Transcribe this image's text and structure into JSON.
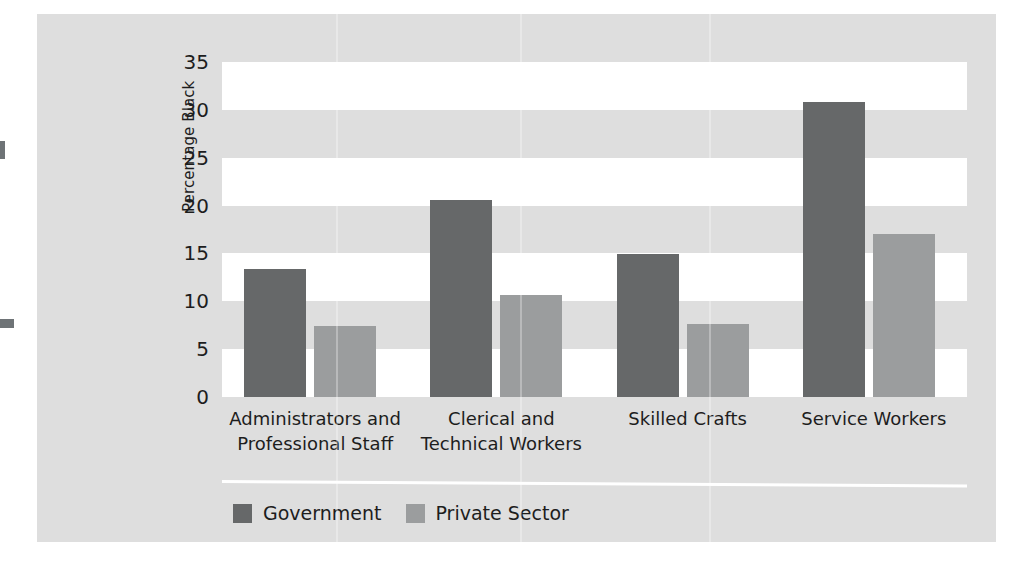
{
  "figure": {
    "panel_color": "#dedede",
    "plot_background": "#ffffff"
  },
  "chart_data": {
    "type": "bar",
    "title": "",
    "xlabel": "",
    "ylabel": "Percentage Black",
    "ylim": [
      0,
      35
    ],
    "yticks": [
      0,
      5,
      10,
      15,
      20,
      25,
      30,
      35
    ],
    "ytick_labels": [
      "0",
      "5",
      "10",
      "15",
      "20",
      "25",
      "30",
      "35"
    ],
    "grid": "horizontal alternating white bands",
    "legend_position": "bottom-left",
    "categories": [
      "Administrators and\nProfessional Staff",
      "Clerical and\nTechnical Workers",
      "Skilled Crafts",
      "Service Workers"
    ],
    "series": [
      {
        "name": "Government",
        "color": "#666869",
        "values": [
          13.4,
          20.6,
          14.9,
          30.8
        ]
      },
      {
        "name": "Private Sector",
        "color": "#9b9d9e",
        "values": [
          7.4,
          10.7,
          7.6,
          17.0
        ]
      }
    ]
  }
}
